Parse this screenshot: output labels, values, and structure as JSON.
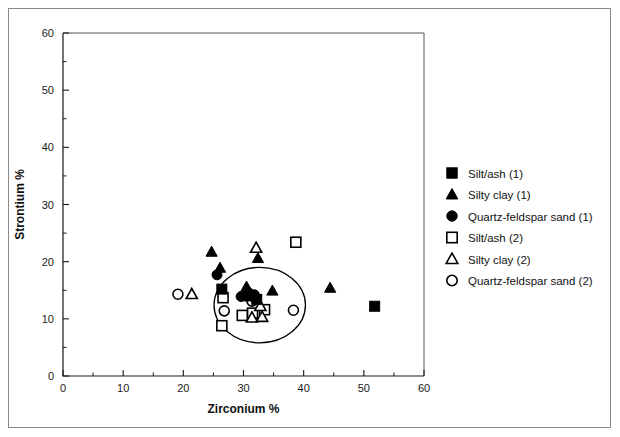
{
  "chart_data": {
    "type": "scatter",
    "title": "",
    "xlabel": "Zirconium %",
    "ylabel": "Strontium %",
    "xlim": [
      0,
      60
    ],
    "ylim": [
      0,
      60
    ],
    "xticks": [
      0,
      10,
      20,
      30,
      40,
      50,
      60
    ],
    "yticks": [
      0,
      10,
      20,
      30,
      40,
      50,
      60
    ],
    "xtick_labels": [
      "0",
      "10",
      "20",
      "30",
      "40",
      "50",
      "60"
    ],
    "ytick_labels": [
      "0",
      "10",
      "20",
      "30",
      "40",
      "50",
      "60"
    ],
    "minor_tick_interval": 5,
    "grid": false,
    "legend_position": "right",
    "series": [
      {
        "name": "Silt/ash (1)",
        "marker": "filled-square",
        "color": "#000000",
        "points": [
          {
            "x": 26.4,
            "y": 15.2
          },
          {
            "x": 31.0,
            "y": 14.0
          },
          {
            "x": 32.2,
            "y": 13.4
          },
          {
            "x": 51.8,
            "y": 12.2
          }
        ]
      },
      {
        "name": "Silty clay (1)",
        "marker": "filled-triangle",
        "color": "#000000",
        "points": [
          {
            "x": 24.7,
            "y": 21.7
          },
          {
            "x": 32.4,
            "y": 20.6
          },
          {
            "x": 30.5,
            "y": 15.6
          },
          {
            "x": 34.8,
            "y": 14.9
          },
          {
            "x": 44.4,
            "y": 15.4
          },
          {
            "x": 26.1,
            "y": 18.9
          }
        ]
      },
      {
        "name": "Quartz-feldspar sand (1)",
        "marker": "filled-circle",
        "color": "#000000",
        "points": [
          {
            "x": 25.6,
            "y": 17.7
          },
          {
            "x": 30.8,
            "y": 14.6
          },
          {
            "x": 31.8,
            "y": 14.2
          },
          {
            "x": 29.6,
            "y": 13.9
          }
        ]
      },
      {
        "name": "Silt/ash (2)",
        "marker": "open-square",
        "color": "#000000",
        "points": [
          {
            "x": 38.7,
            "y": 23.4
          },
          {
            "x": 26.6,
            "y": 13.7
          },
          {
            "x": 26.4,
            "y": 8.8
          },
          {
            "x": 31.5,
            "y": 11.0
          },
          {
            "x": 33.5,
            "y": 11.6
          },
          {
            "x": 29.8,
            "y": 10.6
          }
        ]
      },
      {
        "name": "Silty clay (2)",
        "marker": "open-triangle",
        "color": "#000000",
        "points": [
          {
            "x": 21.4,
            "y": 14.3
          },
          {
            "x": 32.1,
            "y": 22.4
          },
          {
            "x": 31.4,
            "y": 10.2
          },
          {
            "x": 33.1,
            "y": 10.3
          },
          {
            "x": 32.8,
            "y": 12.2
          }
        ]
      },
      {
        "name": "Quartz-feldspar sand (2)",
        "marker": "open-circle",
        "color": "#000000",
        "points": [
          {
            "x": 19.1,
            "y": 14.3
          },
          {
            "x": 26.8,
            "y": 11.4
          },
          {
            "x": 31.4,
            "y": 13.1
          },
          {
            "x": 38.3,
            "y": 11.5
          }
        ]
      }
    ],
    "annotations": [
      {
        "type": "ellipse",
        "label": "cluster-ellipse",
        "center_x": 32.7,
        "center_y": 12.4,
        "radius_x": 7.6,
        "radius_y": 6.6
      }
    ]
  },
  "legend": {
    "items": [
      {
        "label": "Silt/ash (1)",
        "marker": "filled-square"
      },
      {
        "label": "Silty clay (1)",
        "marker": "filled-triangle"
      },
      {
        "label": "Quartz-feldspar sand (1)",
        "marker": "filled-circle"
      },
      {
        "label": "Silt/ash (2)",
        "marker": "open-square"
      },
      {
        "label": "Silty clay (2)",
        "marker": "open-triangle"
      },
      {
        "label": "Quartz-feldspar sand (2)",
        "marker": "open-circle"
      }
    ]
  }
}
